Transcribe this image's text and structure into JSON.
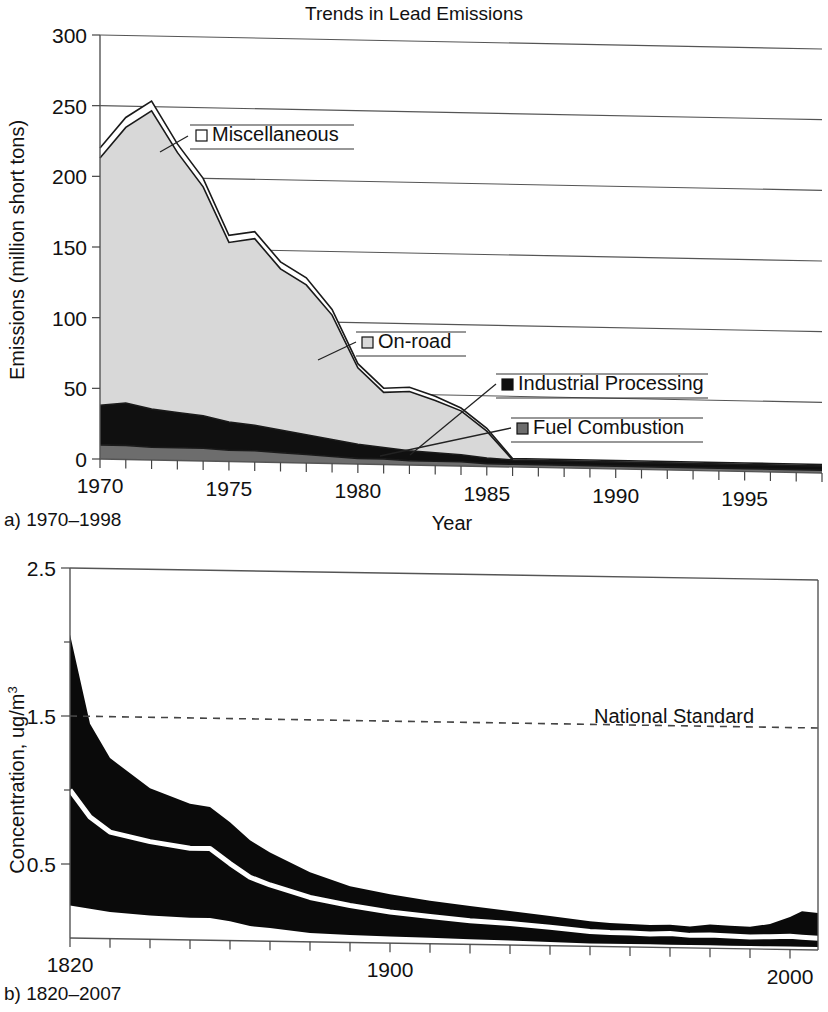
{
  "page": {
    "width": 828,
    "height": 1012,
    "background": "#ffffff"
  },
  "panel_a": {
    "title": "Trends in Lead Emissions",
    "caption": "a) 1970–1998",
    "xlabel": "Year",
    "ylabel": "Emissions (million short tons)",
    "legend": [
      {
        "label": "Miscellaneous",
        "swatch": "#ffffff",
        "swatch_name": "legend-swatch-miscellaneous"
      },
      {
        "label": "On-road",
        "swatch": "#d8d8d8",
        "swatch_name": "legend-swatch-on-road"
      },
      {
        "label": "Industrial Processing",
        "swatch": "#101010",
        "swatch_name": "legend-swatch-industrial-processing"
      },
      {
        "label": "Fuel Combustion",
        "swatch": "#6d6d6d",
        "swatch_name": "legend-swatch-fuel-combustion"
      }
    ]
  },
  "panel_b": {
    "caption": "b) 1820–2007",
    "ylabel_main": "Concentration, ug/m",
    "ylabel_exponent": "3",
    "annotation": "National Standard",
    "standard_value": 1.5
  },
  "chart_data": [
    {
      "id": "panel-a",
      "type": "area",
      "stacked": true,
      "title": "Trends in Lead Emissions",
      "subtitle": "a) 1970–1998",
      "xlabel": "Year",
      "ylabel": "Emissions (million short tons)",
      "xlim": [
        1970,
        1998
      ],
      "ylim": [
        0,
        300
      ],
      "xticks": [
        1970,
        1975,
        1980,
        1985,
        1990,
        1995
      ],
      "xtick_labels": [
        "1970",
        "1975",
        "1980",
        "1985",
        "1990",
        "1995"
      ],
      "minor_xtick_step": 1,
      "yticks": [
        0,
        50,
        100,
        150,
        200,
        250,
        300
      ],
      "ytick_labels": [
        "0",
        "50",
        "100",
        "150",
        "200",
        "250",
        "300"
      ],
      "grid": "horizontal",
      "legend_position": "inside-annotated",
      "x": [
        1970,
        1971,
        1972,
        1973,
        1974,
        1975,
        1976,
        1977,
        1978,
        1979,
        1980,
        1981,
        1982,
        1983,
        1984,
        1985,
        1986,
        1987,
        1988,
        1989,
        1990,
        1991,
        1992,
        1993,
        1994,
        1995,
        1996,
        1997,
        1998
      ],
      "series": [
        {
          "name": "Fuel Combustion",
          "color": "#6d6d6d",
          "values": [
            10,
            10,
            9,
            9,
            9,
            8,
            8,
            7,
            6,
            5,
            4,
            4,
            3,
            3,
            3,
            2,
            2,
            2,
            2,
            2,
            2,
            2,
            2,
            2,
            2,
            2,
            2,
            2,
            2
          ]
        },
        {
          "name": "Industrial Processing",
          "color": "#101010",
          "values": [
            28,
            30,
            27,
            25,
            23,
            20,
            18,
            16,
            14,
            12,
            10,
            8,
            7,
            6,
            5,
            4,
            3,
            3,
            3,
            3,
            3,
            3,
            3,
            3,
            3,
            3,
            3,
            3,
            3
          ]
        },
        {
          "name": "On-road",
          "color": "#d8d8d8",
          "values": [
            175,
            195,
            211,
            184,
            162,
            127,
            132,
            114,
            106,
            88,
            54,
            39,
            42,
            37,
            31,
            19,
            0,
            0,
            0,
            0,
            0,
            0,
            0,
            0,
            0,
            0,
            0,
            0,
            0
          ]
        },
        {
          "name": "Miscellaneous",
          "color": "#ffffff",
          "values": [
            7,
            7,
            7,
            6,
            6,
            5,
            5,
            5,
            5,
            4,
            3,
            3,
            3,
            3,
            2,
            2,
            1,
            1,
            1,
            1,
            1,
            1,
            1,
            1,
            1,
            1,
            1,
            1,
            1
          ]
        }
      ],
      "totals": [
        220,
        242,
        254,
        224,
        200,
        160,
        163,
        142,
        131,
        109,
        71,
        54,
        55,
        49,
        41,
        27,
        6,
        6,
        6,
        6,
        6,
        6,
        6,
        6,
        6,
        6,
        6,
        6,
        6
      ]
    },
    {
      "id": "panel-b",
      "type": "area",
      "subtitle": "b) 1820–2007",
      "ylabel": "Concentration, ug/m3",
      "xlabel": "",
      "xlim": [
        1820,
        2007
      ],
      "ylim": [
        0,
        2.5
      ],
      "xticks": [
        1820,
        1900,
        2000
      ],
      "xtick_labels": [
        "1820",
        "1900",
        "2000"
      ],
      "minor_xtick_step": 10,
      "yticks": [
        0.5,
        1.5,
        2.5
      ],
      "ytick_labels": [
        "0.5",
        "1.5",
        "2.5"
      ],
      "minor_yticks": [
        1.0,
        2.0
      ],
      "grid": "none",
      "annotations": [
        {
          "text": "National Standard",
          "y": 1.5,
          "style": "dashed-line"
        }
      ],
      "x": [
        1820,
        1825,
        1830,
        1840,
        1850,
        1855,
        1860,
        1865,
        1870,
        1880,
        1890,
        1900,
        1910,
        1920,
        1930,
        1940,
        1950,
        1955,
        1960,
        1965,
        1970,
        1975,
        1980,
        1985,
        1990,
        1995,
        2000,
        2003,
        2007
      ],
      "band_upper": [
        2.05,
        1.45,
        1.22,
        1.02,
        0.92,
        0.9,
        0.8,
        0.68,
        0.6,
        0.47,
        0.38,
        0.33,
        0.29,
        0.26,
        0.23,
        0.2,
        0.17,
        0.16,
        0.155,
        0.15,
        0.155,
        0.145,
        0.16,
        0.155,
        0.15,
        0.17,
        0.22,
        0.26,
        0.25
      ],
      "band_lower": [
        0.22,
        0.2,
        0.18,
        0.16,
        0.15,
        0.15,
        0.13,
        0.1,
        0.09,
        0.06,
        0.05,
        0.045,
        0.04,
        0.035,
        0.03,
        0.025,
        0.02,
        0.02,
        0.02,
        0.02,
        0.02,
        0.02,
        0.02,
        0.02,
        0.02,
        0.02,
        0.02,
        0.02,
        0.02
      ],
      "median": [
        1.0,
        0.82,
        0.72,
        0.66,
        0.62,
        0.62,
        0.52,
        0.43,
        0.38,
        0.3,
        0.25,
        0.21,
        0.185,
        0.16,
        0.145,
        0.125,
        0.1,
        0.095,
        0.095,
        0.09,
        0.095,
        0.085,
        0.09,
        0.085,
        0.08,
        0.085,
        0.09,
        0.085,
        0.08
      ]
    }
  ]
}
